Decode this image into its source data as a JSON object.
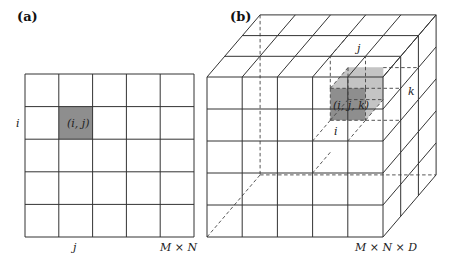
{
  "figure": {
    "panel_a": {
      "label": "(a)",
      "grid_rows": 5,
      "grid_cols": 5,
      "highlight_cell": {
        "row": 1,
        "col": 1,
        "label": "(i, j)"
      },
      "row_label": "i",
      "col_label": "j",
      "size_label": "M × N"
    },
    "panel_b": {
      "label": "(b)",
      "grid_rows": 5,
      "grid_cols": 5,
      "grid_depth": 3,
      "highlight_voxel": {
        "row": 1,
        "col": 3,
        "depth": 1,
        "label": "(i, j, k)"
      },
      "i_label": "i",
      "j_label": "j",
      "k_label": "k",
      "size_label": "M × N × D"
    },
    "colors": {
      "highlight_front": "#8e8e8e",
      "highlight_back": "#c4c4c4",
      "line": "#333333"
    }
  }
}
